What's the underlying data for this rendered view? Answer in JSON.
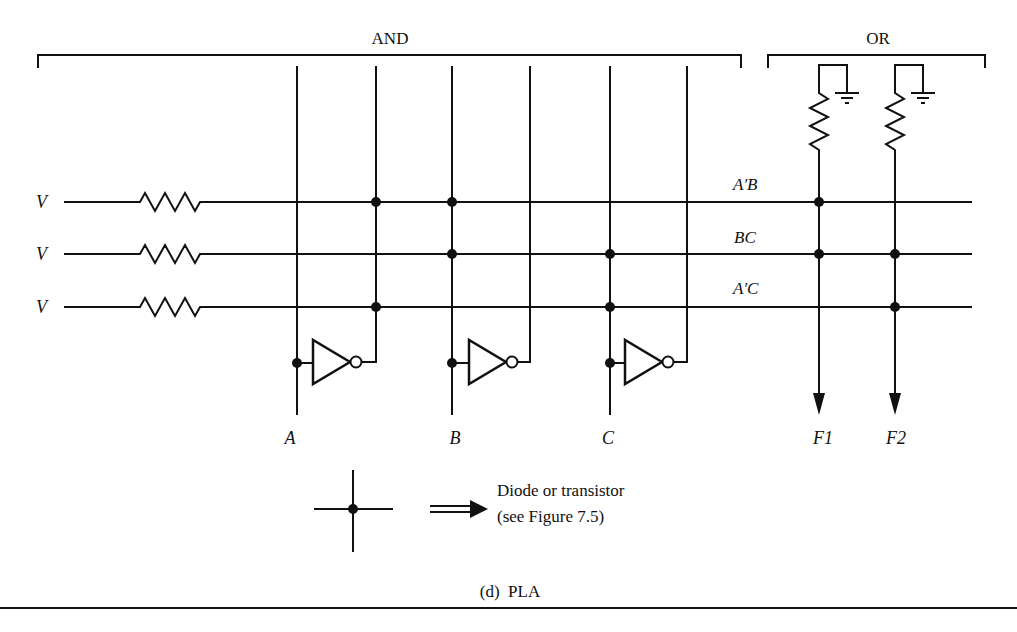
{
  "sections": {
    "and_label": "AND",
    "or_label": "OR"
  },
  "inputs": [
    {
      "label": "A",
      "x": 297,
      "not_x": 376
    },
    {
      "label": "B",
      "x": 452,
      "not_x": 530
    },
    {
      "label": "C",
      "x": 610,
      "not_x": 687
    }
  ],
  "product_terms": [
    {
      "source": "V",
      "label": "A′B",
      "y": 202,
      "and_dots": [
        376,
        452
      ],
      "or_dots": [
        819
      ]
    },
    {
      "source": "V",
      "label": "BC",
      "y": 254,
      "and_dots": [
        452,
        610
      ],
      "or_dots": [
        819,
        895
      ]
    },
    {
      "source": "V",
      "label": "A′C",
      "y": 307,
      "and_dots": [
        376,
        610
      ],
      "or_dots": [
        895
      ]
    }
  ],
  "outputs": [
    {
      "label": "F1",
      "x": 819
    },
    {
      "label": "F2",
      "x": 895
    }
  ],
  "legend": {
    "line1": "Diode or transistor",
    "line2": "(see Figure 7.5)"
  },
  "caption": "(d)  PLA",
  "colors": {
    "ink": "#111111",
    "background": "#ffffff"
  }
}
